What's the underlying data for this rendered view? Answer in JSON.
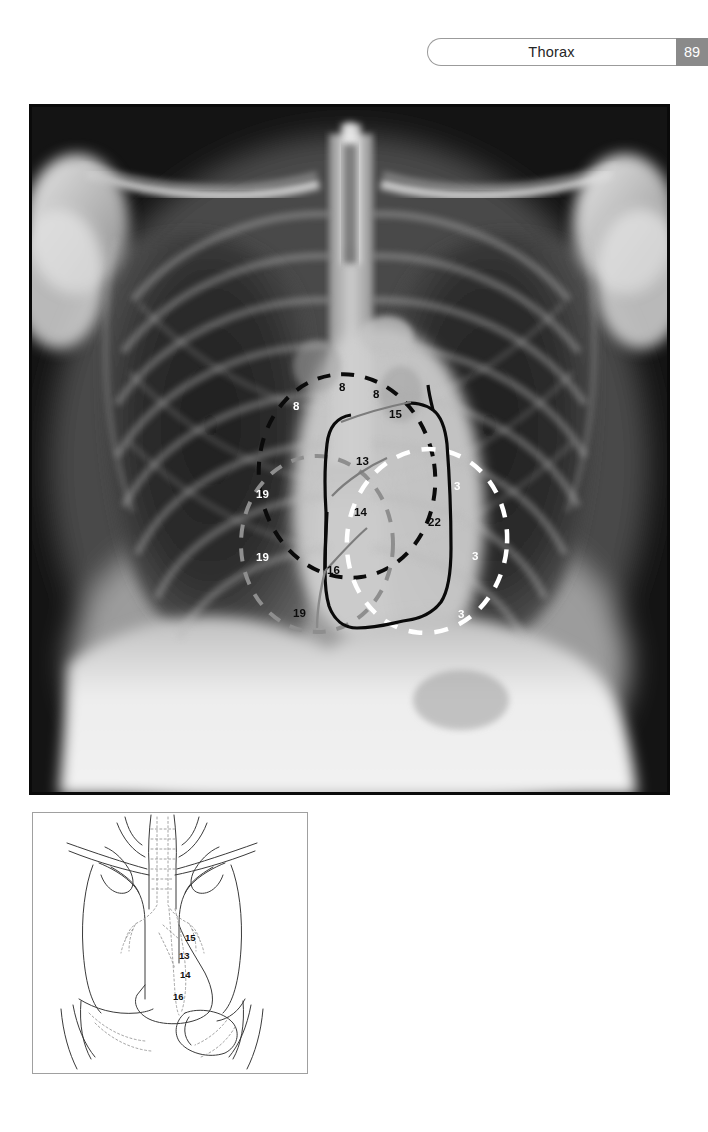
{
  "header": {
    "title": "Thorax",
    "page_number": "89",
    "pill_border_color": "#9b9b9b",
    "page_box_color": "#8a8a8a"
  },
  "radiograph": {
    "name": "chest-pa-radiograph",
    "modality_hint": "chest x-ray frontal projection",
    "overlay_colors": {
      "black_dashed": "#0b0b0b",
      "white_dashed": "#ffffff",
      "gray_dashed": "#8e8e8e",
      "solid_black_outline": "#0a0a0a",
      "gray_leader": "#7c7c7c"
    },
    "annotations": [
      {
        "id": "a1",
        "text": "8",
        "color": "white",
        "left": 264,
        "top": 297
      },
      {
        "id": "a2",
        "text": "8",
        "color": "black",
        "left": 310,
        "top": 278
      },
      {
        "id": "a3",
        "text": "8",
        "color": "black",
        "left": 344,
        "top": 285
      },
      {
        "id": "a4",
        "text": "15",
        "color": "black",
        "left": 360,
        "top": 305
      },
      {
        "id": "a5",
        "text": "13",
        "color": "black",
        "left": 327,
        "top": 352
      },
      {
        "id": "a6",
        "text": "14",
        "color": "black",
        "left": 325,
        "top": 403
      },
      {
        "id": "a7",
        "text": "16",
        "color": "black",
        "left": 298,
        "top": 461
      },
      {
        "id": "a8",
        "text": "22",
        "color": "black",
        "left": 399,
        "top": 413
      },
      {
        "id": "a9",
        "text": "19",
        "color": "white",
        "left": 227,
        "top": 385
      },
      {
        "id": "a10",
        "text": "19",
        "color": "white",
        "left": 227,
        "top": 448
      },
      {
        "id": "a11",
        "text": "19",
        "color": "black",
        "left": 264,
        "top": 504
      },
      {
        "id": "a12",
        "text": "3",
        "color": "white",
        "left": 425,
        "top": 377
      },
      {
        "id": "a13",
        "text": "3",
        "color": "white",
        "left": 443,
        "top": 447
      },
      {
        "id": "a14",
        "text": "3",
        "color": "white",
        "left": 429,
        "top": 505
      }
    ]
  },
  "diagram": {
    "name": "thoracic-viscera-line-drawing",
    "border_color": "#a0a0a0",
    "line_color": "#3a3a3a",
    "dotted_color": "#9a9a9a",
    "annotations": [
      {
        "id": "d1",
        "text": "15",
        "left": 152,
        "top": 120
      },
      {
        "id": "d2",
        "text": "13",
        "left": 146,
        "top": 138
      },
      {
        "id": "d3",
        "text": "14",
        "left": 147,
        "top": 157
      },
      {
        "id": "d4",
        "text": "16",
        "left": 140,
        "top": 179
      }
    ]
  }
}
